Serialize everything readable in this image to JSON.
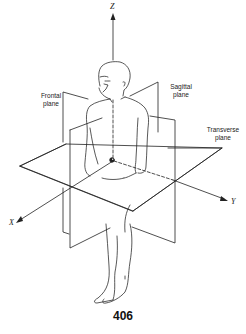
{
  "figure": {
    "labels": {
      "frontal_plane": [
        "Frontal",
        "plane"
      ],
      "sagittal_plane": [
        "Sagittal",
        "plane"
      ],
      "transverse_plane": [
        "Transverse",
        "plane"
      ]
    },
    "axes": {
      "z": "Z",
      "x": "X",
      "y": "Y"
    },
    "colors": {
      "line": "#222222",
      "background": "#ffffff"
    }
  },
  "page": {
    "number": "406"
  }
}
